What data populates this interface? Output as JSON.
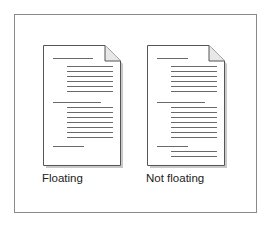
{
  "figure": {
    "colors": {
      "border": "#8a8a8a",
      "line": "#6a6a6a",
      "shadow": "#c8c8c8",
      "text": "#222222"
    },
    "documents": [
      {
        "label": "Floating",
        "left": 43,
        "lines": [
          {
            "x": 10,
            "y": 13,
            "w": 40
          },
          {
            "x": 24,
            "y": 21,
            "w": 46
          },
          {
            "x": 24,
            "y": 26,
            "w": 46
          },
          {
            "x": 24,
            "y": 31,
            "w": 46
          },
          {
            "x": 24,
            "y": 36,
            "w": 46
          },
          {
            "x": 24,
            "y": 41,
            "w": 46
          },
          {
            "x": 24,
            "y": 46,
            "w": 46
          },
          {
            "x": 10,
            "y": 57,
            "w": 48
          },
          {
            "x": 24,
            "y": 62,
            "w": 46
          },
          {
            "x": 24,
            "y": 67,
            "w": 46
          },
          {
            "x": 24,
            "y": 72,
            "w": 46
          },
          {
            "x": 24,
            "y": 77,
            "w": 46
          },
          {
            "x": 24,
            "y": 82,
            "w": 46
          },
          {
            "x": 24,
            "y": 87,
            "w": 46
          },
          {
            "x": 24,
            "y": 92,
            "w": 46
          },
          {
            "x": 10,
            "y": 101,
            "w": 31
          }
        ]
      },
      {
        "label": "Not floating",
        "left": 147,
        "lines": [
          {
            "x": 10,
            "y": 13,
            "w": 31
          },
          {
            "x": 24,
            "y": 21,
            "w": 46
          },
          {
            "x": 24,
            "y": 26,
            "w": 46
          },
          {
            "x": 24,
            "y": 31,
            "w": 46
          },
          {
            "x": 24,
            "y": 36,
            "w": 46
          },
          {
            "x": 24,
            "y": 41,
            "w": 46
          },
          {
            "x": 24,
            "y": 46,
            "w": 46
          },
          {
            "x": 10,
            "y": 57,
            "w": 48
          },
          {
            "x": 24,
            "y": 62,
            "w": 46
          },
          {
            "x": 24,
            "y": 67,
            "w": 46
          },
          {
            "x": 24,
            "y": 72,
            "w": 46
          },
          {
            "x": 24,
            "y": 77,
            "w": 46
          },
          {
            "x": 24,
            "y": 82,
            "w": 46
          },
          {
            "x": 24,
            "y": 87,
            "w": 46
          },
          {
            "x": 24,
            "y": 92,
            "w": 46
          },
          {
            "x": 10,
            "y": 101,
            "w": 31
          },
          {
            "x": 24,
            "y": 106,
            "w": 46
          },
          {
            "x": 24,
            "y": 111,
            "w": 46
          }
        ]
      }
    ]
  }
}
